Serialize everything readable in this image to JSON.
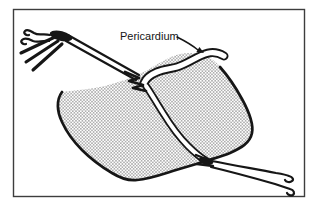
{
  "figure": {
    "kind": "surgical line illustration",
    "label": {
      "text": "Pericardium"
    },
    "colors": {
      "background": "#ffffff",
      "ink": "#161616",
      "frame": "#3d3d3d",
      "stipple_dot": "#222222",
      "flap_fill": "#ffffff"
    },
    "elements": [
      "frame",
      "stippled-tissue",
      "pericardium-flap",
      "suture-thread",
      "upper-stitch-knot",
      "lower-stitch-knot",
      "clamp-knot",
      "suture-free-ends-left",
      "suture-free-ends-right",
      "pericardium-label",
      "label-arrow"
    ]
  }
}
